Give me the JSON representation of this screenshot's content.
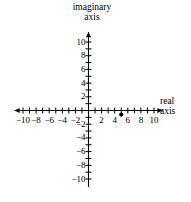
{
  "figure": {
    "name": "complex-plane-axes",
    "background_color": "#ffffff",
    "stroke_color": "#000000"
  },
  "titles": {
    "imaginary_axis_line1": "imaginary",
    "imaginary_axis_line2": "axis",
    "real_axis_line1": "real",
    "real_axis_line2": "axis"
  },
  "chart_data": {
    "type": "scatter",
    "title": "",
    "xlabel": "real axis",
    "ylabel": "imaginary axis",
    "xlim": [
      -11,
      11
    ],
    "ylim": [
      -11,
      11
    ],
    "grid": false,
    "legend": null,
    "x_tick_step": 1,
    "y_tick_step": 1,
    "x_label_step": 2,
    "y_label_step": 2,
    "x_tick_labels": [
      "-10",
      "-8",
      "-6",
      "-4",
      "-2",
      "2",
      "4",
      "6",
      "8",
      "10"
    ],
    "x_tick_values": [
      -10,
      -8,
      -6,
      -4,
      -2,
      2,
      4,
      6,
      8,
      10
    ],
    "y_tick_labels": [
      "10",
      "8",
      "6",
      "4",
      "2",
      "-2",
      "-4",
      "-6",
      "-8",
      "-10"
    ],
    "y_tick_values": [
      10,
      8,
      6,
      4,
      2,
      -2,
      -4,
      -6,
      -8,
      -10
    ],
    "points": [
      {
        "label": "",
        "x": 5,
        "y": -0.6
      }
    ],
    "series": [
      {
        "name": "plotted-point",
        "x": [
          5
        ],
        "y": [
          -0.6
        ],
        "marker": "filled-circle",
        "color": "#000000"
      }
    ],
    "arrows": {
      "x_left": true,
      "x_right": true,
      "y_top": true,
      "y_bottom": false
    }
  }
}
